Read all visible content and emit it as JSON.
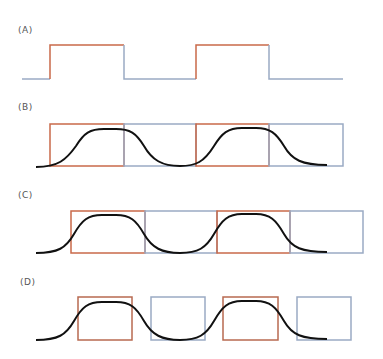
{
  "colors": {
    "on": "#c9694a",
    "off": "#9aaac4",
    "curve": "#111111"
  },
  "panels": [
    {
      "label": "(A)",
      "label_x": 20,
      "label_y": 26
    },
    {
      "label": "(B)",
      "label_x": 20,
      "label_y": 103
    },
    {
      "label": "(C)",
      "label_x": 20,
      "label_y": 191
    },
    {
      "label": "(D)",
      "label_x": 21,
      "label_y": 278
    }
  ]
}
